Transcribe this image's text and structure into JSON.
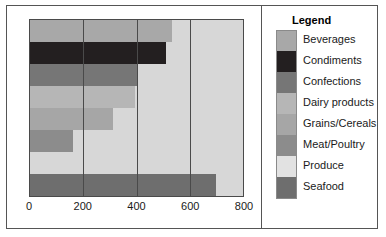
{
  "chart_data": {
    "type": "bar",
    "orientation": "horizontal",
    "title": "",
    "xlabel": "",
    "ylabel": "",
    "xlim": [
      0,
      800
    ],
    "xticks": [
      0,
      200,
      400,
      600,
      800
    ],
    "xtick_labels": [
      "0",
      "200",
      "400",
      "600",
      "800"
    ],
    "grid": true,
    "grid_axis": "x",
    "legend_position": "right",
    "legend_title": "Legend",
    "categories": [
      "Beverages",
      "Condiments",
      "Confections",
      "Dairy products",
      "Grains/Cereals",
      "Meat/Poultry",
      "Produce",
      "Seafood"
    ],
    "values": [
      535,
      510,
      400,
      395,
      310,
      160,
      0,
      700
    ],
    "colors": [
      "#a8a8a8",
      "#231f20",
      "#767676",
      "#b6b6b6",
      "#a6a6a6",
      "#8c8c8c",
      "#e2e2e2",
      "#6e6e6e"
    ],
    "plot_background": "#d7d7d7"
  },
  "legend": {
    "title": "Legend",
    "items": [
      {
        "label": "Beverages",
        "color": "#a8a8a8"
      },
      {
        "label": "Condiments",
        "color": "#231f20"
      },
      {
        "label": "Confections",
        "color": "#767676"
      },
      {
        "label": "Dairy products",
        "color": "#b6b6b6"
      },
      {
        "label": "Grains/Cereals",
        "color": "#a6a6a6"
      },
      {
        "label": "Meat/Poultry",
        "color": "#8c8c8c"
      },
      {
        "label": "Produce",
        "color": "#e2e2e2"
      },
      {
        "label": "Seafood",
        "color": "#6e6e6e"
      }
    ]
  }
}
